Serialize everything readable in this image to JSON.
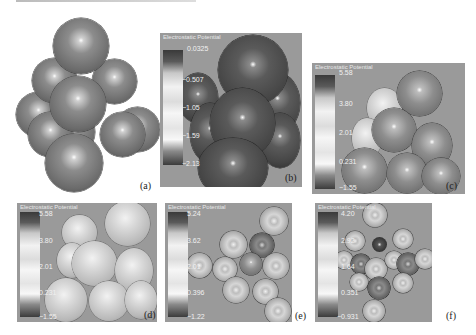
{
  "figure": {
    "panels": [
      {
        "id": "a",
        "label": "(a)",
        "type": "cluster-model",
        "legend": null
      },
      {
        "id": "b",
        "label": "(b)",
        "type": "electrostatic-potential-map",
        "legend": {
          "title": "Electrostatic Potential",
          "ticks": [
            "0.0325",
            "−0.507",
            "−1.05",
            "−1.59",
            "−2.13"
          ]
        }
      },
      {
        "id": "c",
        "label": "(c)",
        "type": "electrostatic-potential-map",
        "legend": {
          "title": "Electrostatic Potential",
          "ticks": [
            "5.58",
            "3.80",
            "2.01",
            "0.231",
            "−1.55"
          ]
        }
      },
      {
        "id": "d",
        "label": "(d)",
        "type": "electrostatic-potential-map",
        "legend": {
          "title": "Electrostatic Potential",
          "ticks": [
            "5.58",
            "3.80",
            "2.01",
            "0.231",
            "−1.55"
          ]
        }
      },
      {
        "id": "e",
        "label": "(e)",
        "type": "electrostatic-potential-map",
        "legend": {
          "title": "Electrostatic Potential",
          "ticks": [
            "5.24",
            "3.62",
            "2.01",
            "0.396",
            "−1.22"
          ]
        }
      },
      {
        "id": "f",
        "label": "(f)",
        "type": "electrostatic-potential-map",
        "legend": {
          "title": "Electrostatic Potential",
          "ticks": [
            "4.20",
            "2.92",
            "1.64",
            "0.351",
            "−0.931"
          ]
        }
      }
    ]
  }
}
